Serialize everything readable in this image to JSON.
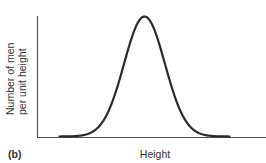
{
  "chart_data": {
    "type": "line",
    "title": "",
    "panel_label": "(b)",
    "xlabel": "Height",
    "ylabel_lines": [
      "Number of men",
      "per unit height"
    ],
    "distribution": "normal",
    "mean": 0.5,
    "stddev": 0.095,
    "xlim": [
      0,
      1
    ],
    "ylim": [
      0,
      1
    ],
    "peak_value": 1.0,
    "grid": false,
    "ticks": false,
    "line_color": "#2b2b2b",
    "axis_color": "#555555"
  }
}
